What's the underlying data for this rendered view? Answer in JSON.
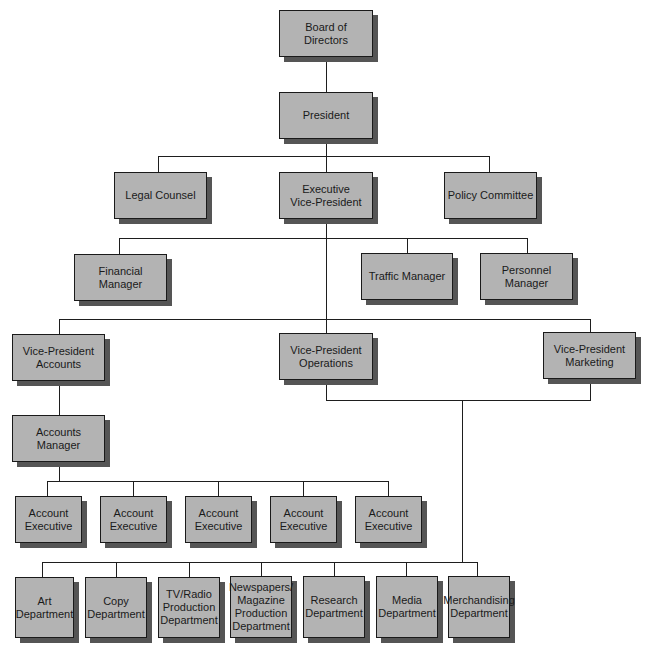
{
  "colors": {
    "box_fill": "#b3b3b3",
    "box_border": "#1a1a1a",
    "box_shadow": "#555555",
    "line": "#1e1e1e",
    "background": "#ffffff"
  },
  "nodes": {
    "board": {
      "label": "Board of Directors"
    },
    "president": {
      "label": "President"
    },
    "legal_counsel": {
      "label": "Legal Counsel"
    },
    "exec_vp": {
      "label": "Executive\nVice-President"
    },
    "policy_committee": {
      "label": "Policy Committee"
    },
    "financial_manager": {
      "label": "Financial Manager"
    },
    "traffic_manager": {
      "label": "Traffic Manager"
    },
    "personnel_manager": {
      "label": "Personnel Manager"
    },
    "vp_accounts": {
      "label": "Vice-President\nAccounts"
    },
    "vp_operations": {
      "label": "Vice-President\nOperations"
    },
    "vp_marketing": {
      "label": "Vice-President\nMarketing"
    },
    "accounts_manager": {
      "label": "Accounts\nManager"
    },
    "account_executives": [
      {
        "label": "Account\nExecutive"
      },
      {
        "label": "Account\nExecutive"
      },
      {
        "label": "Account\nExecutive"
      },
      {
        "label": "Account\nExecutive"
      },
      {
        "label": "Account\nExecutive"
      }
    ],
    "departments": [
      {
        "label": "Art\nDepartment"
      },
      {
        "label": "Copy\nDepartment"
      },
      {
        "label": "TV/Radio\nProduction\nDepartment"
      },
      {
        "label": "Newspapers/\nMagazine\nProduction\nDepartment"
      },
      {
        "label": "Research\nDepartment"
      },
      {
        "label": "Media\nDepartment"
      },
      {
        "label": "Merchandising\nDepartment"
      }
    ]
  },
  "edges": [
    [
      "board",
      "president"
    ],
    [
      "president",
      "legal_counsel"
    ],
    [
      "president",
      "exec_vp"
    ],
    [
      "president",
      "policy_committee"
    ],
    [
      "exec_vp",
      "financial_manager"
    ],
    [
      "exec_vp",
      "traffic_manager"
    ],
    [
      "exec_vp",
      "personnel_manager"
    ],
    [
      "exec_vp",
      "vp_accounts"
    ],
    [
      "exec_vp",
      "vp_operations"
    ],
    [
      "exec_vp",
      "vp_marketing"
    ],
    [
      "vp_accounts",
      "accounts_manager"
    ],
    [
      "accounts_manager",
      "account_executives"
    ],
    [
      "vp_operations+vp_marketing",
      "departments"
    ]
  ]
}
